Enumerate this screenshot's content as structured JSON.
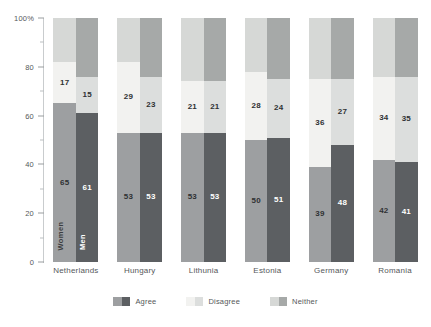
{
  "chart_data": {
    "type": "bar",
    "subtype": "stacked-bar-grouped-100pct",
    "title": "",
    "xlabel": "",
    "ylabel": "",
    "ylim": [
      0,
      100
    ],
    "ytick_labels": [
      "0",
      "20",
      "40",
      "60",
      "80",
      "100%"
    ],
    "ytick_values": [
      0,
      20,
      40,
      60,
      80,
      100
    ],
    "yminor_values": [
      10,
      30,
      50,
      70,
      90
    ],
    "grid": false,
    "legend_position": "bottom-center",
    "categories": [
      "Netherlands",
      "Hungary",
      "Lithunia",
      "Estonia",
      "Germany",
      "Romania"
    ],
    "stack_order_bottom_to_top": [
      "Agree",
      "Disagree",
      "Neither"
    ],
    "legend": [
      {
        "label": "Agree",
        "women_color": "#9d9fa1",
        "men_color": "#5c5f62"
      },
      {
        "label": "Disagree",
        "women_color": "#f2f2f0",
        "men_color": "#dcdedd"
      },
      {
        "label": "Neither",
        "women_color": "#d6d8d6",
        "men_color": "#a6a9a8"
      }
    ],
    "series": [
      {
        "name": "Women",
        "bar_label": "Women",
        "label_color": "#3b3d3f",
        "colors": {
          "Agree": "#9d9fa1",
          "Disagree": "#f2f2f0",
          "Neither": "#d6d8d6"
        },
        "value_text_color": "dark",
        "values": {
          "Agree": [
            65,
            53,
            53,
            50,
            39,
            42
          ],
          "Disagree": [
            17,
            29,
            21,
            28,
            36,
            34
          ],
          "Neither": [
            18,
            18,
            26,
            22,
            25,
            24
          ]
        },
        "shown_labels": {
          "Agree": [
            "65",
            "53",
            "53",
            "50",
            "39",
            "42"
          ],
          "Disagree": [
            "17",
            "29",
            "21",
            "28",
            "36",
            "34"
          ],
          "Neither": [
            "",
            "",
            "",
            "",
            "",
            ""
          ]
        }
      },
      {
        "name": "Men",
        "bar_label": "Men",
        "label_color": "#ffffff",
        "colors": {
          "Agree": "#5c5f62",
          "Disagree": "#dcdedd",
          "Neither": "#a6a9a8"
        },
        "value_text_color": "mixed",
        "values": {
          "Agree": [
            61,
            53,
            53,
            51,
            48,
            41
          ],
          "Disagree": [
            15,
            23,
            21,
            24,
            27,
            35
          ],
          "Neither": [
            24,
            24,
            26,
            25,
            25,
            24
          ]
        },
        "shown_labels": {
          "Agree": [
            "61",
            "53",
            "53",
            "51",
            "48",
            "41"
          ],
          "Disagree": [
            "15",
            "23",
            "21",
            "24",
            "27",
            "35"
          ],
          "Neither": [
            "",
            "",
            "",
            "",
            "",
            ""
          ]
        }
      }
    ]
  }
}
